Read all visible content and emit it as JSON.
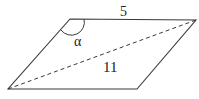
{
  "diagram": {
    "type": "parallelogram",
    "labels": {
      "top_side": "5",
      "diagonal": "11",
      "angle": "α"
    },
    "vertices": {
      "top_left": [
        70,
        19
      ],
      "top_right": [
        196,
        20
      ],
      "bottom_right": [
        137,
        89
      ],
      "bottom_left": [
        8,
        89
      ]
    },
    "colors": {
      "stroke": "#3a3a3a",
      "text": "#222222",
      "background": "#ffffff"
    }
  }
}
